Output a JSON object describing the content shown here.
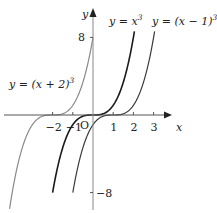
{
  "chart_data": {
    "type": "line",
    "title": "",
    "xlabel": "x",
    "ylabel": "y",
    "origin_label": "O",
    "xlim": [
      -3.5,
      4
    ],
    "ylim": [
      -9,
      11
    ],
    "grid": false,
    "x_ticks": [
      {
        "value": -2,
        "label": "−2"
      },
      {
        "value": -1,
        "label": "−1"
      },
      {
        "value": 1,
        "label": "1"
      },
      {
        "value": 2,
        "label": "2"
      },
      {
        "value": 3,
        "label": "3"
      }
    ],
    "y_ticks": [
      {
        "value": 8,
        "label": "8"
      },
      {
        "value": -8,
        "label": "−8"
      }
    ],
    "series": [
      {
        "name": "y = (x + 2)^3",
        "label_main": "y = (x + 2)",
        "label_exp": "3",
        "shift": -2,
        "color": "#8a8a8a",
        "x_range": [
          -5.4,
          0
        ]
      },
      {
        "name": "y = x^3",
        "label_main": "y = x",
        "label_exp": "3",
        "shift": 0,
        "color": "#1a1a1a",
        "x_range": [
          -2,
          2.05
        ]
      },
      {
        "name": "y = (x − 1)^3",
        "label_main": "y = (x − 1)",
        "label_exp": "3",
        "shift": 1,
        "color": "#3a3a3a",
        "x_range": [
          -1,
          3.05
        ]
      }
    ]
  }
}
